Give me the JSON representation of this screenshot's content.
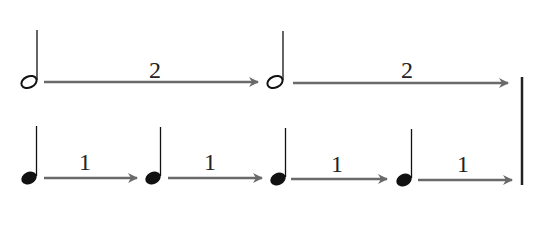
{
  "diagram": {
    "rows": [
      {
        "name": "half-notes",
        "notes": [
          {
            "type": "half",
            "duration_label": "2"
          },
          {
            "type": "half",
            "duration_label": "2"
          }
        ]
      },
      {
        "name": "quarter-notes",
        "notes": [
          {
            "type": "quarter",
            "duration_label": "1"
          },
          {
            "type": "quarter",
            "duration_label": "1"
          },
          {
            "type": "quarter",
            "duration_label": "1"
          },
          {
            "type": "quarter",
            "duration_label": "1"
          }
        ]
      }
    ],
    "end_marker": "barline",
    "colors": {
      "note": "#111111",
      "arrow": "#6a6a6a",
      "barline": "#222222"
    }
  }
}
